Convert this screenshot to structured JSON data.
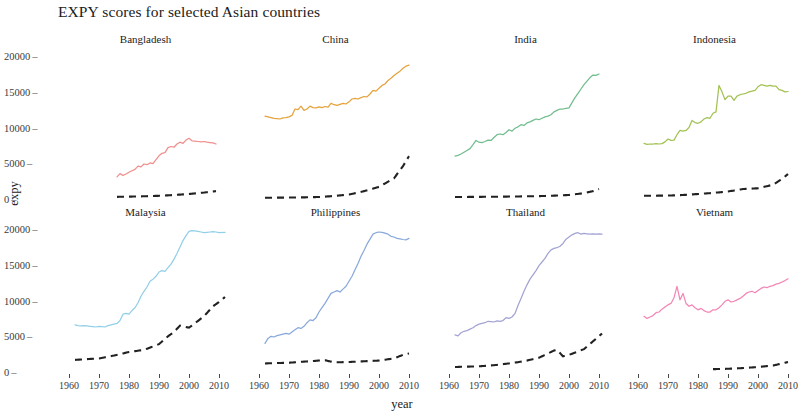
{
  "chart_data": {
    "type": "line",
    "title": "EXPY scores for selected Asian countries",
    "xlabel": "year",
    "ylabel": "expy",
    "xlim": [
      1958,
      2013
    ],
    "ylim": [
      0,
      21000
    ],
    "xticks": [
      1960,
      1970,
      1980,
      1990,
      2000,
      2010
    ],
    "xtick_labels": [
      "1960",
      "1970",
      "1980",
      "1990",
      "2000",
      "2010"
    ],
    "yticks": [
      0,
      5000,
      10000,
      15000,
      20000
    ],
    "ytick_labels": [
      "0",
      "5000",
      "10000",
      "15000",
      "20000"
    ],
    "grid": false,
    "legend": "none",
    "facet_layout": {
      "rows": 2,
      "cols": 4
    },
    "series_kinds": [
      {
        "name": "expy",
        "style": "solid",
        "note": "colored per facet"
      },
      {
        "name": "gdp per capita",
        "style": "dashed",
        "color": "#222222"
      }
    ],
    "panels": [
      {
        "name": "Bangladesh",
        "color": "#ef8f8c",
        "expy": {
          "x": [
            1976,
            1977,
            1978,
            1979,
            1980,
            1981,
            1982,
            1983,
            1984,
            1985,
            1986,
            1987,
            1988,
            1989,
            1990,
            1991,
            1992,
            1993,
            1994,
            1995,
            1996,
            1997,
            1998,
            1999,
            2000,
            2001,
            2002,
            2003,
            2004,
            2005,
            2006,
            2007,
            2008,
            2009
          ],
          "y": [
            3100,
            3550,
            3300,
            3500,
            3750,
            3950,
            4150,
            4600,
            4500,
            4900,
            4800,
            5050,
            4950,
            5500,
            6050,
            6400,
            6500,
            7200,
            7350,
            7250,
            7700,
            7950,
            7800,
            8250,
            8500,
            8150,
            8100,
            8050,
            8000,
            8050,
            7950,
            7900,
            7850,
            7700
          ]
        },
        "gdp": {
          "x": [
            1976,
            1980,
            1985,
            1990,
            1995,
            2000,
            2005,
            2009
          ],
          "y": [
            300,
            330,
            380,
            450,
            560,
            700,
            900,
            1100
          ]
        }
      },
      {
        "name": "China",
        "color": "#e6a33c",
        "expy": {
          "x": [
            1962,
            1963,
            1964,
            1965,
            1966,
            1967,
            1968,
            1969,
            1970,
            1971,
            1972,
            1973,
            1974,
            1975,
            1976,
            1977,
            1978,
            1979,
            1980,
            1981,
            1982,
            1983,
            1984,
            1985,
            1986,
            1987,
            1988,
            1989,
            1990,
            1991,
            1992,
            1993,
            1994,
            1995,
            1996,
            1997,
            1998,
            1999,
            2000,
            2001,
            2002,
            2003,
            2004,
            2005,
            2006,
            2007,
            2008,
            2009,
            2010
          ],
          "y": [
            11600,
            11500,
            11400,
            11300,
            11250,
            11200,
            11350,
            11400,
            11500,
            11700,
            12600,
            12500,
            13000,
            12400,
            12600,
            13000,
            12800,
            12750,
            12900,
            12800,
            12950,
            12850,
            13400,
            13200,
            13100,
            13250,
            13400,
            13300,
            13600,
            14000,
            14100,
            14000,
            14200,
            14350,
            14300,
            14700,
            15200,
            15100,
            15500,
            15900,
            16100,
            16600,
            16900,
            17300,
            17600,
            17900,
            18300,
            18600,
            18750
          ]
        },
        "gdp": {
          "x": [
            1962,
            1970,
            1975,
            1980,
            1985,
            1990,
            1995,
            2000,
            2005,
            2008,
            2010
          ],
          "y": [
            180,
            200,
            230,
            280,
            420,
            620,
            1100,
            1700,
            2900,
            4600,
            6000
          ]
        }
      },
      {
        "name": "India",
        "color": "#72bd8e",
        "expy": {
          "x": [
            1962,
            1963,
            1964,
            1965,
            1966,
            1967,
            1968,
            1969,
            1970,
            1971,
            1972,
            1973,
            1974,
            1975,
            1976,
            1977,
            1978,
            1979,
            1980,
            1981,
            1982,
            1983,
            1984,
            1985,
            1986,
            1987,
            1988,
            1989,
            1990,
            1991,
            1992,
            1993,
            1994,
            1995,
            1996,
            1997,
            1998,
            1999,
            2000,
            2001,
            2002,
            2003,
            2004,
            2005,
            2006,
            2007,
            2008,
            2009,
            2010
          ],
          "y": [
            6000,
            6100,
            6300,
            6550,
            6800,
            7050,
            7600,
            8200,
            7950,
            7900,
            8050,
            8250,
            8200,
            8600,
            9000,
            9100,
            9000,
            9300,
            9700,
            9500,
            9900,
            10100,
            10400,
            10300,
            10650,
            10800,
            11000,
            11200,
            11100,
            11300,
            11500,
            11600,
            11800,
            12200,
            12400,
            12600,
            12600,
            12700,
            12750,
            13500,
            14200,
            14800,
            15400,
            16000,
            16500,
            17000,
            17350,
            17300,
            17500
          ]
        },
        "gdp": {
          "x": [
            1962,
            1970,
            1980,
            1990,
            1995,
            2000,
            2005,
            2008,
            2010
          ],
          "y": [
            280,
            300,
            340,
            400,
            470,
            560,
            820,
            1100,
            1400
          ]
        }
      },
      {
        "name": "Indonesia",
        "color": "#a3c253",
        "expy": {
          "x": [
            1962,
            1963,
            1964,
            1965,
            1966,
            1967,
            1968,
            1969,
            1970,
            1971,
            1972,
            1973,
            1974,
            1975,
            1976,
            1977,
            1978,
            1979,
            1980,
            1981,
            1982,
            1983,
            1984,
            1985,
            1986,
            1987,
            1988,
            1989,
            1990,
            1991,
            1992,
            1993,
            1994,
            1995,
            1996,
            1997,
            1998,
            1999,
            2000,
            2001,
            2002,
            2003,
            2004,
            2005,
            2006,
            2007,
            2008,
            2009,
            2010
          ],
          "y": [
            7800,
            7650,
            7700,
            7700,
            7750,
            7700,
            7750,
            8000,
            8400,
            8200,
            8250,
            9000,
            9600,
            9500,
            9600,
            10000,
            11000,
            10700,
            10600,
            10800,
            11200,
            11400,
            11300,
            12000,
            12200,
            15900,
            15000,
            13900,
            14400,
            14400,
            13800,
            14400,
            14600,
            14700,
            14800,
            15000,
            15100,
            15200,
            15700,
            16000,
            15900,
            15800,
            15900,
            15800,
            15800,
            15300,
            15200,
            15000,
            15050
          ]
        },
        "gdp": {
          "x": [
            1962,
            1970,
            1975,
            1980,
            1985,
            1990,
            1995,
            2000,
            2005,
            2008,
            2010
          ],
          "y": [
            450,
            480,
            560,
            700,
            850,
            1050,
            1400,
            1500,
            2000,
            2800,
            3500
          ]
        }
      },
      {
        "name": "Malaysia",
        "color": "#92cfe8",
        "expy": {
          "x": [
            1962,
            1963,
            1964,
            1965,
            1966,
            1967,
            1968,
            1969,
            1970,
            1971,
            1972,
            1973,
            1974,
            1975,
            1976,
            1977,
            1978,
            1979,
            1980,
            1981,
            1982,
            1983,
            1984,
            1985,
            1986,
            1987,
            1988,
            1989,
            1990,
            1991,
            1992,
            1993,
            1994,
            1995,
            1996,
            1997,
            1998,
            1999,
            2000,
            2001,
            2002,
            2003,
            2004,
            2005,
            2006,
            2007,
            2008,
            2009,
            2010,
            2012
          ],
          "y": [
            6600,
            6500,
            6450,
            6500,
            6450,
            6400,
            6350,
            6300,
            6400,
            6350,
            6300,
            6500,
            6600,
            6700,
            6800,
            7200,
            8100,
            8200,
            8100,
            8600,
            9000,
            9700,
            10600,
            11300,
            11900,
            12700,
            13000,
            13400,
            14000,
            14200,
            14100,
            14600,
            15100,
            15800,
            16600,
            17500,
            18400,
            19100,
            19700,
            19800,
            19750,
            19700,
            19600,
            19500,
            19550,
            19600,
            19650,
            19600,
            19500,
            19550
          ]
        },
        "gdp": {
          "x": [
            1962,
            1970,
            1975,
            1980,
            1985,
            1990,
            1993,
            1995,
            1997,
            2000,
            2005,
            2008,
            2010,
            2012
          ],
          "y": [
            1700,
            1900,
            2300,
            2800,
            3100,
            3900,
            5000,
            5600,
            6500,
            6200,
            7800,
            9200,
            9800,
            10500
          ]
        }
      },
      {
        "name": "Philippines",
        "color": "#8aa9da",
        "expy": {
          "x": [
            1962,
            1963,
            1964,
            1965,
            1966,
            1967,
            1968,
            1969,
            1970,
            1971,
            1972,
            1973,
            1974,
            1975,
            1976,
            1977,
            1978,
            1979,
            1980,
            1981,
            1982,
            1983,
            1984,
            1985,
            1986,
            1987,
            1988,
            1989,
            1990,
            1991,
            1992,
            1993,
            1994,
            1995,
            1996,
            1997,
            1998,
            1999,
            2000,
            2001,
            2002,
            2003,
            2004,
            2005,
            2006,
            2007,
            2008,
            2009,
            2010
          ],
          "y": [
            4000,
            4700,
            5000,
            4900,
            5100,
            5200,
            5300,
            5400,
            5300,
            5600,
            5900,
            6200,
            6100,
            6400,
            6900,
            7300,
            7200,
            7600,
            8400,
            9000,
            9600,
            10300,
            11000,
            11200,
            11400,
            11200,
            11600,
            12000,
            12700,
            13400,
            14300,
            15200,
            16200,
            17000,
            17900,
            18600,
            19300,
            19500,
            19600,
            19550,
            19450,
            19300,
            19000,
            18900,
            18700,
            18650,
            18550,
            18500,
            18700
          ]
        },
        "gdp": {
          "x": [
            1962,
            1970,
            1975,
            1980,
            1982,
            1985,
            1990,
            1995,
            2000,
            2005,
            2008,
            2010
          ],
          "y": [
            1200,
            1300,
            1450,
            1600,
            1650,
            1350,
            1400,
            1500,
            1600,
            1900,
            2400,
            2600
          ]
        }
      },
      {
        "name": "Thailand",
        "color": "#a3a3d4",
        "expy": {
          "x": [
            1962,
            1963,
            1964,
            1965,
            1966,
            1967,
            1968,
            1969,
            1970,
            1971,
            1972,
            1973,
            1974,
            1975,
            1976,
            1977,
            1978,
            1979,
            1980,
            1981,
            1982,
            1983,
            1984,
            1985,
            1986,
            1987,
            1988,
            1989,
            1990,
            1991,
            1992,
            1993,
            1994,
            1995,
            1996,
            1997,
            1998,
            1999,
            2000,
            2001,
            2002,
            2003,
            2004,
            2005,
            2006,
            2007,
            2008,
            2009,
            2010,
            2011
          ],
          "y": [
            5200,
            5050,
            5500,
            5700,
            5800,
            6000,
            6200,
            6500,
            6700,
            6800,
            6900,
            7100,
            7050,
            7000,
            7150,
            7100,
            7200,
            7600,
            7500,
            7700,
            8200,
            9300,
            10300,
            11300,
            12200,
            13000,
            13600,
            14200,
            14900,
            15400,
            15900,
            16600,
            17100,
            17300,
            17400,
            17600,
            18000,
            18600,
            18900,
            19200,
            19400,
            19500,
            19300,
            19400,
            19350,
            19300,
            19350,
            19300,
            19350,
            19300
          ]
        },
        "gdp": {
          "x": [
            1962,
            1970,
            1975,
            1980,
            1985,
            1990,
            1995,
            1996,
            1998,
            2000,
            2005,
            2008,
            2010,
            2011
          ],
          "y": [
            700,
            800,
            950,
            1200,
            1500,
            2000,
            3000,
            3100,
            2200,
            2400,
            3200,
            4300,
            5000,
            5400
          ]
        }
      },
      {
        "name": "Vietnam",
        "color": "#f386b6",
        "expy": {
          "x": [
            1962,
            1963,
            1964,
            1965,
            1966,
            1967,
            1968,
            1969,
            1970,
            1971,
            1972,
            1973,
            1974,
            1975,
            1976,
            1977,
            1978,
            1979,
            1980,
            1981,
            1982,
            1983,
            1984,
            1985,
            1986,
            1987,
            1988,
            1989,
            1990,
            1991,
            1992,
            1993,
            1994,
            1995,
            1996,
            1997,
            1998,
            1999,
            2000,
            2001,
            2002,
            2003,
            2004,
            2005,
            2006,
            2007,
            2008,
            2009,
            2010
          ],
          "y": [
            7800,
            7500,
            7700,
            7900,
            8300,
            8400,
            8800,
            9100,
            9400,
            9600,
            10400,
            12000,
            10100,
            11000,
            9600,
            9200,
            9400,
            9000,
            8700,
            8900,
            8600,
            8400,
            8400,
            8700,
            8700,
            9000,
            9400,
            9900,
            10100,
            9800,
            9900,
            10100,
            10300,
            10600,
            11000,
            11200,
            11300,
            11100,
            11400,
            11700,
            11900,
            11800,
            12000,
            12100,
            12300,
            12400,
            12600,
            12800,
            13050
          ]
        },
        "gdp": {
          "x": [
            1985,
            1990,
            1995,
            2000,
            2005,
            2008,
            2010
          ],
          "y": [
            400,
            450,
            550,
            700,
            900,
            1200,
            1400
          ]
        }
      }
    ]
  }
}
